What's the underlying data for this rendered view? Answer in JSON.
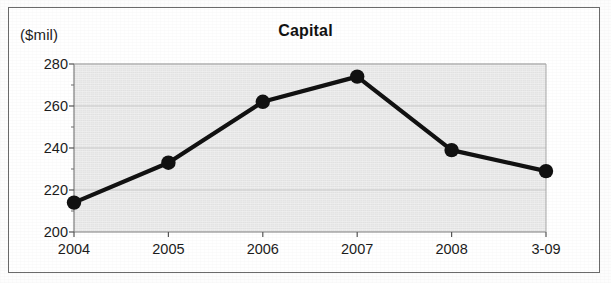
{
  "chart_data": {
    "type": "line",
    "title": "Capital",
    "ylabel": "($mil)",
    "xlabel": "",
    "categories": [
      "2004",
      "2005",
      "2006",
      "2007",
      "2008",
      "3-09"
    ],
    "values": [
      214,
      233,
      262,
      274,
      239,
      229
    ],
    "series": [
      {
        "name": "Capital",
        "values": [
          214,
          233,
          262,
          274,
          239,
          229
        ]
      }
    ],
    "ylim": [
      200,
      280
    ],
    "yticks": [
      200,
      220,
      240,
      260,
      280
    ],
    "ytick_labels": [
      "200",
      "220",
      "240",
      "260",
      "280"
    ],
    "y_minor_tick_interval": 10,
    "xtick_labels": [
      "2004",
      "2005",
      "2006",
      "2007",
      "2008",
      "3-09"
    ],
    "grid": true,
    "grid_axis": "y",
    "legend": false,
    "legend_position": "none",
    "marker": "circle",
    "marker_color": "#111111",
    "line_color": "#111111",
    "plot_background_color": "#e4e4e4",
    "figure_background_color": "#ffffff",
    "border_color": "#6b6b6b",
    "text_color": "#1c1c1c"
  }
}
